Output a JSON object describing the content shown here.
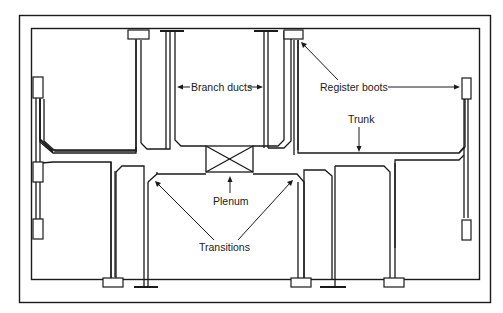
{
  "diagram": {
    "type": "forced-air duct system layout (extended plenum)",
    "labels": {
      "branch_ducts": "Branch ducts",
      "register_boots": "Register boots",
      "trunk": "Trunk",
      "plenum": "Plenum",
      "transitions": "Transitions"
    },
    "colors": {
      "line": "#1a1a1a",
      "background": "#ffffff"
    }
  }
}
